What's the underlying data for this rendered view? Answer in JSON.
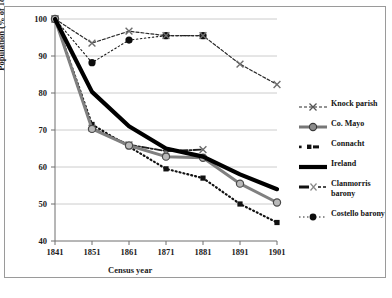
{
  "chart_data": {
    "type": "line",
    "title": "",
    "xlabel": "Census year",
    "ylabel": "Population (% of 1841 number)",
    "x": [
      1841,
      1851,
      1861,
      1871,
      1881,
      1891,
      1901
    ],
    "xticklabels": [
      "1841",
      "1851",
      "1861",
      "1871",
      "1881",
      "1891",
      "1901"
    ],
    "yticklabels": [
      "40",
      "50",
      "60",
      "70",
      "80",
      "90",
      "100"
    ],
    "yticks": [
      40,
      50,
      60,
      70,
      80,
      90,
      100
    ],
    "ylim": [
      40,
      100
    ],
    "xlim": [
      1841,
      1901
    ],
    "grid": "horizontal",
    "legend_position": "right",
    "series": [
      {
        "name": "Knock parish",
        "marker": "x",
        "linestyle": "dashed",
        "color": "#2b2b2b",
        "x": [
          1841,
          1851,
          1861,
          1871,
          1881,
          1891,
          1901
        ],
        "values": [
          100,
          93.5,
          96.7,
          95.5,
          95.5,
          87.8,
          82.3
        ]
      },
      {
        "name": "Co. Mayo",
        "marker": "open-circle",
        "linestyle": "solid",
        "color": "#7a7a7a",
        "x": [
          1841,
          1851,
          1861,
          1871,
          1881,
          1891,
          1901
        ],
        "values": [
          100,
          70.3,
          65.8,
          62.8,
          62.5,
          55.5,
          50.4
        ]
      },
      {
        "name": "Connacht",
        "marker": "small-square",
        "linestyle": "dotted",
        "color": "#111111",
        "x": [
          1841,
          1851,
          1861,
          1871,
          1881,
          1891,
          1901
        ],
        "values": [
          100,
          71.5,
          65.5,
          59.5,
          57.0,
          50.0,
          45.0
        ]
      },
      {
        "name": "Ireland",
        "marker": "none",
        "linestyle": "solid-thick",
        "color": "#000000",
        "x": [
          1841,
          1851,
          1861,
          1871,
          1881,
          1891,
          1901
        ],
        "values": [
          100,
          80.3,
          71.0,
          65.0,
          62.8,
          58.0,
          54.0
        ]
      },
      {
        "name": "Clanmorris barony",
        "marker": "x",
        "linestyle": "dash-dot",
        "color": "#333333",
        "x": [
          1841,
          1851,
          1861,
          1871,
          1881
        ],
        "values": [
          100,
          70.5,
          66.0,
          64.3,
          64.7
        ]
      },
      {
        "name": "Costello barony",
        "marker": "filled-circle",
        "linestyle": "dotted",
        "color": "#0d0d0d",
        "x": [
          1841,
          1851,
          1861,
          1871,
          1881
        ],
        "values": [
          100,
          88.2,
          94.3,
          95.5,
          95.5
        ]
      }
    ]
  },
  "legend": {
    "items": [
      {
        "label": "Knock parish"
      },
      {
        "label": "Co. Mayo"
      },
      {
        "label": "Connacht"
      },
      {
        "label": "Ireland"
      },
      {
        "label": "Clanmorris barony"
      },
      {
        "label": "Costello barony"
      }
    ]
  },
  "axes": {
    "x_title": "Census year",
    "y_title": "Population (% of 1841 number)"
  }
}
